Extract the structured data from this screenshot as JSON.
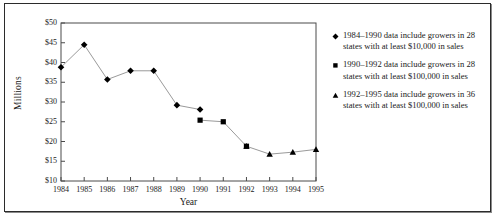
{
  "chart_data": {
    "type": "line",
    "title": "",
    "xlabel": "Year",
    "ylabel": "Millions",
    "grid": false,
    "legend_position": "right",
    "x": [
      1984,
      1985,
      1986,
      1987,
      1988,
      1989,
      1990,
      1991,
      1992,
      1993,
      1994,
      1995
    ],
    "xtick_labels": [
      "1984",
      "1985",
      "1986",
      "1987",
      "1988",
      "1989",
      "1990",
      "1991",
      "1992",
      "1993",
      "1994",
      "1995"
    ],
    "ytick_labels": [
      "$10",
      "$15",
      "$20",
      "$25",
      "$30",
      "$35",
      "$40",
      "$45",
      "$50"
    ],
    "ytick_values": [
      10,
      15,
      20,
      25,
      30,
      35,
      40,
      45,
      50
    ],
    "ylim": [
      10,
      50
    ],
    "xlim": [
      1984,
      1995
    ],
    "series": [
      {
        "name": "1984–1990 data include growers in 28 states with at least $10,000 in sales",
        "marker": "diamond",
        "x": [
          1984,
          1985,
          1986,
          1987,
          1988,
          1989,
          1990
        ],
        "values": [
          38.8,
          44.5,
          35.7,
          37.9,
          37.9,
          29.2,
          28.1
        ]
      },
      {
        "name": "1990–1992 data include growers in 28 states with at least $100,000 in sales",
        "marker": "square",
        "x": [
          1990,
          1991,
          1992
        ],
        "values": [
          25.4,
          25.0,
          18.8
        ]
      },
      {
        "name": "1992–1995 data include growers in 36 states with at least $100,000 in sales",
        "marker": "triangle",
        "x": [
          1992,
          1993,
          1994,
          1995
        ],
        "values": [
          18.8,
          16.8,
          17.3,
          18.0
        ]
      }
    ]
  },
  "axes": {
    "y_title": "Millions",
    "x_title": "Year"
  },
  "legend": {
    "items": [
      {
        "marker": "diamond-marker-icon",
        "line1": "1984–1990 data include growers in 28",
        "line2": "states with at least $10,000 in sales"
      },
      {
        "marker": "square-marker-icon",
        "line1": "1990–1992 data include growers in 28",
        "line2": "states with at least $100,000 in sales"
      },
      {
        "marker": "triangle-marker-icon",
        "line1": "1992–1995 data include growers in 36",
        "line2": "states with at least $100,000 in sales"
      }
    ]
  },
  "colors": {
    "frame": "#2b2b2b",
    "axis": "#4a4a4a",
    "line": "#9a9a9a",
    "marker": "#000000",
    "text": "#1a1a1a",
    "background": "#ffffff"
  }
}
